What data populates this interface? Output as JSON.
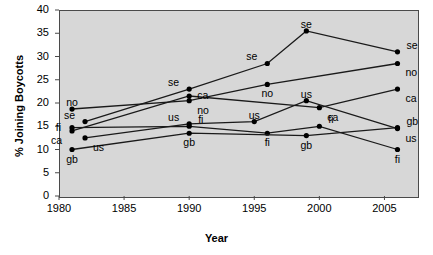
{
  "chart_data": {
    "type": "line",
    "title": "",
    "xlabel": "Year",
    "ylabel": "% Joining Boycotts",
    "xlim": [
      1980,
      2007.5
    ],
    "ylim": [
      0,
      40
    ],
    "grid": false,
    "legend": "none",
    "annotation_style": "series code labelled at each data point",
    "xticks": [
      1980,
      1985,
      1990,
      1995,
      2000,
      2005
    ],
    "xtick_labels": [
      "1980",
      "1985",
      "1990",
      "1995",
      "2000",
      "2005"
    ],
    "yticks": [
      0,
      5,
      10,
      15,
      20,
      25,
      30,
      35,
      40
    ],
    "ytick_labels": [
      "0",
      "5",
      "10",
      "15",
      "20",
      "25",
      "30",
      "35",
      "40"
    ],
    "series": [
      {
        "name": "se",
        "label": "se",
        "points": [
          {
            "x": 1982,
            "y": 16.0,
            "label": "se",
            "lpos": "above-left"
          },
          {
            "x": 1990,
            "y": 23.0,
            "label": "se",
            "lpos": "above-left"
          },
          {
            "x": 1996,
            "y": 28.5,
            "label": "se",
            "lpos": "above-left"
          },
          {
            "x": 1999,
            "y": 35.5,
            "label": "se",
            "lpos": "above"
          },
          {
            "x": 2006,
            "y": 31.0,
            "label": "se",
            "lpos": "above-right"
          }
        ]
      },
      {
        "name": "no",
        "label": "no",
        "points": [
          {
            "x": 1981,
            "y": 18.7,
            "label": "no",
            "lpos": "above"
          },
          {
            "x": 1990,
            "y": 20.5,
            "label": "no",
            "lpos": "below-right"
          },
          {
            "x": 1996,
            "y": 24.0,
            "label": "no",
            "lpos": "below"
          },
          {
            "x": 2006,
            "y": 28.5,
            "label": "no",
            "lpos": "below-right"
          }
        ]
      },
      {
        "name": "ca",
        "label": "ca",
        "points": [
          {
            "x": 1981,
            "y": 14.0,
            "label": "ca",
            "lpos": "below-left"
          },
          {
            "x": 1990,
            "y": 21.5,
            "label": "ca",
            "lpos": "right"
          },
          {
            "x": 2000,
            "y": 19.0,
            "label": "ca",
            "lpos": "below-right"
          },
          {
            "x": 2006,
            "y": 23.0,
            "label": "ca",
            "lpos": "below-right"
          }
        ]
      },
      {
        "name": "us",
        "label": "us",
        "points": [
          {
            "x": 1982,
            "y": 12.5,
            "label": "us",
            "lpos": "below-right"
          },
          {
            "x": 1990,
            "y": 15.5,
            "label": "us",
            "lpos": "above-left"
          },
          {
            "x": 1995,
            "y": 16.0,
            "label": "us",
            "lpos": "above"
          },
          {
            "x": 1999,
            "y": 20.5,
            "label": "us",
            "lpos": "above"
          },
          {
            "x": 2006,
            "y": 14.5,
            "label": "us",
            "lpos": "below-right"
          }
        ]
      },
      {
        "name": "fi",
        "label": "fi",
        "points": [
          {
            "x": 1981,
            "y": 14.7,
            "label": "fi",
            "lpos": "left"
          },
          {
            "x": 1990,
            "y": 15.0,
            "label": "fi",
            "lpos": "above-right"
          },
          {
            "x": 1996,
            "y": 13.5,
            "label": "fi",
            "lpos": "below"
          },
          {
            "x": 2000,
            "y": 15.0,
            "label": "fi",
            "lpos": "above-right"
          },
          {
            "x": 2006,
            "y": 10.0,
            "label": "fi",
            "lpos": "below"
          }
        ]
      },
      {
        "name": "gb",
        "label": "gb",
        "points": [
          {
            "x": 1981,
            "y": 10.0,
            "label": "gb",
            "lpos": "below"
          },
          {
            "x": 1990,
            "y": 13.5,
            "label": "gb",
            "lpos": "below"
          },
          {
            "x": 1999,
            "y": 13.0,
            "label": "gb",
            "lpos": "below"
          },
          {
            "x": 2006,
            "y": 14.7,
            "label": "gb",
            "lpos": "above-right"
          }
        ]
      }
    ],
    "colors": {
      "line": "#1a1a1a",
      "marker": "#000000",
      "plot_background": "#d7d7d7",
      "axis": "#4a4a4a",
      "text": "#000000",
      "page_background": "#ffffff"
    }
  }
}
